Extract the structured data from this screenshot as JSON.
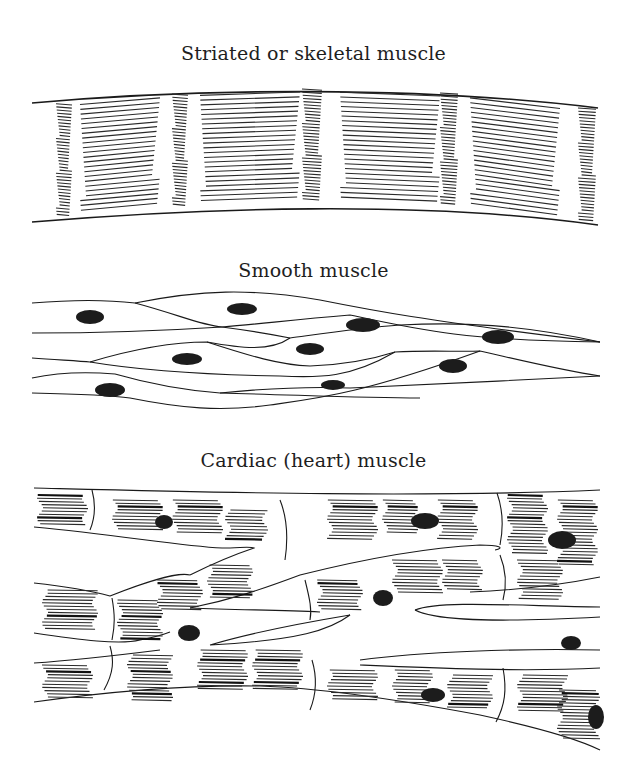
{
  "figure": {
    "panels": [
      {
        "id": "skeletal",
        "caption": "Striated or skeletal muscle"
      },
      {
        "id": "smooth",
        "caption": "Smooth muscle"
      },
      {
        "id": "cardiac",
        "caption": "Cardiac (heart) muscle"
      }
    ],
    "colors": {
      "ink": "#1a1a1a",
      "background": "#ffffff"
    }
  }
}
